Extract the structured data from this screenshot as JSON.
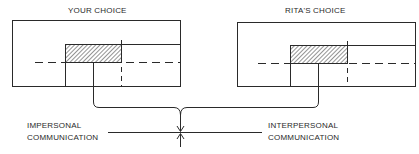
{
  "diagram": {
    "left_panel": {
      "title": "YOUR CHOICE"
    },
    "right_panel": {
      "title": "RITA'S CHOICE"
    },
    "scale": {
      "left_label_line1": "IMPERSONAL",
      "left_label_line2": "COMMUNICATION",
      "right_label_line1": "INTERPERSONAL",
      "right_label_line2": "COMMUNICATION"
    },
    "colors": {
      "line": "#2a2a2a",
      "background": "#ffffff"
    }
  }
}
